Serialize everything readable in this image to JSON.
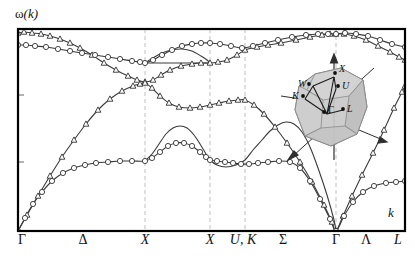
{
  "figure": {
    "type": "phonon-dispersion",
    "ylabel": "ω(k)",
    "ylabel_symbol": "ω",
    "ylabel_arg": "(k)",
    "xlabel": "k",
    "y_axis_ticks_visible": 2,
    "grid": "dashed vertical lines at symmetry points"
  },
  "axis": {
    "x_labels": [
      {
        "text": "Γ",
        "x": 22,
        "italic": false
      },
      {
        "text": "Δ",
        "x": 83,
        "italic": false
      },
      {
        "text": "X",
        "x": 145,
        "italic": true
      },
      {
        "text": "X",
        "x": 210,
        "italic": true
      },
      {
        "text": "U, K",
        "x": 243,
        "italic": true
      },
      {
        "text": "Σ",
        "x": 283,
        "italic": false
      },
      {
        "text": "Γ",
        "x": 336,
        "italic": false
      },
      {
        "text": "Λ",
        "x": 366,
        "italic": false
      },
      {
        "text": "L",
        "x": 398,
        "italic": true
      }
    ],
    "gridlines_x": [
      145,
      210,
      245,
      336
    ],
    "frame": {
      "left": 18,
      "right": 405,
      "top": 29,
      "bottom": 231
    }
  },
  "inset": {
    "name": "fcc-brillouin-zone",
    "points": [
      {
        "label": "X",
        "x": 56,
        "y": 21
      },
      {
        "label": "W",
        "x": 30,
        "y": 32
      },
      {
        "label": "U",
        "x": 59,
        "y": 34
      },
      {
        "label": "K",
        "x": 24,
        "y": 44
      },
      {
        "label": "Γ",
        "x": 45,
        "y": 60
      },
      {
        "label": "L",
        "x": 64,
        "y": 57
      }
    ],
    "fill": "#c9c9c9",
    "stroke": "#6a6a6a"
  },
  "colors": {
    "curve": "#3a3a3a",
    "marker_stroke": "#333333",
    "frame": "#000000",
    "gridline": "#bdbdbd",
    "inset_fill": "#c8c8c8"
  },
  "chart_data": {
    "type": "line",
    "title": "",
    "xlabel": "k",
    "ylabel": "ω(k)",
    "xlim": [
      0,
      1
    ],
    "ylim": [
      0,
      1
    ],
    "grid": true,
    "legend": "none",
    "symmetry_points": [
      "Γ",
      "Δ",
      "X",
      "X",
      "U,K",
      "Σ",
      "Γ",
      "Λ",
      "L"
    ],
    "segment_boundaries_px": [
      18,
      145,
      210,
      245,
      336,
      405
    ],
    "marker_types": {
      "triangle": "longitudinal branch data",
      "circle": "transverse branch data"
    },
    "series": [
      {
        "name": "LO",
        "marker": "triangle",
        "points": [
          [
            18,
            33
          ],
          [
            24,
            32
          ],
          [
            32,
            33
          ],
          [
            41,
            34
          ],
          [
            50,
            36
          ],
          [
            60,
            39
          ],
          [
            70,
            43
          ],
          [
            80,
            48
          ],
          [
            92,
            55
          ],
          [
            104,
            63
          ],
          [
            116,
            70
          ],
          [
            128,
            76
          ],
          [
            137,
            80
          ],
          [
            145,
            82
          ],
          [
            153,
            80
          ],
          [
            161,
            75
          ],
          [
            170,
            70
          ],
          [
            181,
            66
          ],
          [
            192,
            64
          ],
          [
            201,
            63
          ],
          [
            210,
            63
          ],
          [
            218,
            62
          ],
          [
            227,
            60
          ],
          [
            237,
            55
          ],
          [
            245,
            50
          ],
          [
            257,
            47
          ],
          [
            268,
            45
          ],
          [
            281,
            43
          ],
          [
            296,
            40
          ],
          [
            310,
            37
          ],
          [
            322,
            35
          ],
          [
            330,
            34
          ],
          [
            336,
            34
          ],
          [
            344,
            34
          ],
          [
            354,
            36
          ],
          [
            366,
            40
          ],
          [
            378,
            46
          ],
          [
            390,
            52
          ],
          [
            399,
            57
          ],
          [
            405,
            60
          ]
        ]
      },
      {
        "name": "TO",
        "marker": "circle",
        "points": [
          [
            18,
            45
          ],
          [
            26,
            45
          ],
          [
            35,
            46
          ],
          [
            46,
            47
          ],
          [
            58,
            49
          ],
          [
            70,
            51
          ],
          [
            82,
            53
          ],
          [
            95,
            55
          ],
          [
            108,
            57
          ],
          [
            120,
            59
          ],
          [
            132,
            61
          ],
          [
            140,
            62
          ],
          [
            145,
            63
          ],
          [
            153,
            60
          ],
          [
            162,
            55
          ],
          [
            172,
            50
          ],
          [
            182,
            46
          ],
          [
            192,
            44
          ],
          [
            201,
            43
          ],
          [
            210,
            43
          ],
          [
            220,
            44
          ],
          [
            231,
            46
          ],
          [
            242,
            48
          ],
          [
            253,
            46
          ],
          [
            265,
            43
          ],
          [
            278,
            40
          ],
          [
            292,
            37
          ],
          [
            306,
            35
          ],
          [
            318,
            34
          ],
          [
            328,
            34
          ],
          [
            336,
            34
          ],
          [
            345,
            33
          ],
          [
            356,
            34
          ],
          [
            368,
            36
          ],
          [
            380,
            40
          ],
          [
            392,
            44
          ],
          [
            405,
            47
          ]
        ]
      },
      {
        "name": "LA",
        "marker": "triangle",
        "points": [
          [
            18,
            231
          ],
          [
            27,
            215
          ],
          [
            38,
            196
          ],
          [
            50,
            176
          ],
          [
            62,
            157
          ],
          [
            74,
            140
          ],
          [
            86,
            124
          ],
          [
            98,
            110
          ],
          [
            110,
            99
          ],
          [
            122,
            91
          ],
          [
            133,
            86
          ],
          [
            140,
            84
          ],
          [
            145,
            83
          ],
          [
            152,
            88
          ],
          [
            160,
            96
          ],
          [
            169,
            103
          ],
          [
            179,
            107
          ],
          [
            190,
            108
          ],
          [
            200,
            107
          ],
          [
            210,
            105
          ],
          [
            219,
            103
          ],
          [
            229,
            101
          ],
          [
            238,
            100
          ],
          [
            245,
            100
          ],
          [
            254,
            105
          ],
          [
            264,
            114
          ],
          [
            275,
            127
          ],
          [
            287,
            143
          ],
          [
            300,
            162
          ],
          [
            312,
            182
          ],
          [
            324,
            205
          ],
          [
            332,
            222
          ],
          [
            336,
            231
          ],
          [
            343,
            216
          ],
          [
            352,
            196
          ],
          [
            362,
            175
          ],
          [
            373,
            153
          ],
          [
            384,
            130
          ],
          [
            394,
            108
          ],
          [
            402,
            92
          ],
          [
            405,
            86
          ]
        ]
      },
      {
        "name": "TA1",
        "marker": "circle",
        "points": [
          [
            18,
            231
          ],
          [
            25,
            218
          ],
          [
            33,
            204
          ],
          [
            42,
            192
          ],
          [
            52,
            181
          ],
          [
            63,
            173
          ],
          [
            74,
            168
          ],
          [
            85,
            165
          ],
          [
            96,
            163
          ],
          [
            108,
            162
          ],
          [
            120,
            161
          ],
          [
            132,
            161
          ],
          [
            145,
            161
          ],
          [
            152,
            158
          ],
          [
            160,
            152
          ],
          [
            168,
            146
          ],
          [
            176,
            143
          ],
          [
            184,
            143
          ],
          [
            192,
            146
          ],
          [
            200,
            152
          ],
          [
            206,
            157
          ],
          [
            210,
            160
          ],
          [
            217,
            161
          ],
          [
            225,
            162
          ],
          [
            233,
            163
          ],
          [
            241,
            164
          ],
          [
            249,
            164
          ],
          [
            258,
            163
          ],
          [
            268,
            162
          ],
          [
            279,
            161
          ],
          [
            290,
            162
          ],
          [
            300,
            168
          ],
          [
            310,
            181
          ],
          [
            320,
            199
          ],
          [
            330,
            219
          ],
          [
            336,
            231
          ],
          [
            344,
            216
          ],
          [
            353,
            202
          ],
          [
            363,
            192
          ],
          [
            374,
            186
          ],
          [
            386,
            183
          ],
          [
            396,
            182
          ],
          [
            405,
            181
          ]
        ]
      },
      {
        "name": "TA2-hump",
        "marker": "none",
        "points": [
          [
            145,
            161
          ],
          [
            152,
            154
          ],
          [
            159,
            144
          ],
          [
            166,
            134
          ],
          [
            173,
            128
          ],
          [
            180,
            126
          ],
          [
            187,
            128
          ],
          [
            194,
            135
          ],
          [
            200,
            144
          ],
          [
            206,
            154
          ],
          [
            210,
            160
          ],
          [
            217,
            165
          ],
          [
            226,
            167
          ],
          [
            236,
            165
          ],
          [
            245,
            160
          ],
          [
            253,
            150
          ],
          [
            262,
            140
          ],
          [
            270,
            131
          ],
          [
            278,
            125
          ],
          [
            286,
            122
          ],
          [
            294,
            124
          ],
          [
            302,
            132
          ],
          [
            310,
            147
          ],
          [
            318,
            168
          ],
          [
            327,
            195
          ],
          [
            334,
            220
          ],
          [
            336,
            231
          ]
        ]
      },
      {
        "name": "flat-optic-mid",
        "marker": "none",
        "points": [
          [
            145,
            63
          ],
          [
            155,
            63
          ],
          [
            168,
            63
          ],
          [
            182,
            63
          ],
          [
            196,
            63
          ],
          [
            205,
            63
          ],
          [
            210,
            63
          ]
        ]
      },
      {
        "name": "optic-arch-mid",
        "marker": "none",
        "points": [
          [
            145,
            63
          ],
          [
            153,
            58
          ],
          [
            162,
            53
          ],
          [
            172,
            50
          ],
          [
            182,
            49
          ],
          [
            192,
            51
          ],
          [
            201,
            56
          ],
          [
            207,
            60
          ],
          [
            210,
            63
          ]
        ]
      }
    ]
  }
}
